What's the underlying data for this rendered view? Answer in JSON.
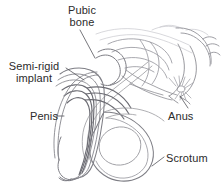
{
  "figure": {
    "type": "anatomical-line-drawing",
    "background_color": "#ffffff",
    "line_color": "#8d8d93",
    "line_color_dark": "#6b6b72",
    "line_color_faint": "#b9b9c0",
    "text_color": "#2b2b2b"
  },
  "labels": {
    "pubic_bone": "Pubic\nbone",
    "semi_rigid_implant": "Semi-rigid\nimplant",
    "penis": "Penis",
    "anus": "Anus",
    "scrotum": "Scrotum"
  }
}
